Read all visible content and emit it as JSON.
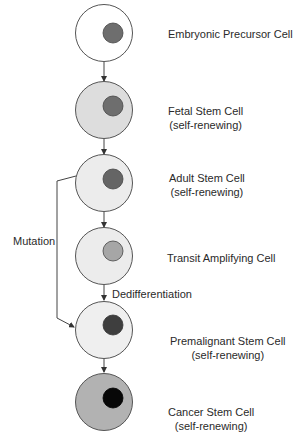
{
  "diagram": {
    "colors": {
      "outline": "#555555",
      "line": "#444444"
    },
    "cells": [
      {
        "id": "embryonic",
        "lines": [
          "Embryonic Precursor Cell"
        ],
        "cx": 104,
        "cy": 33,
        "fill": "#ffffff",
        "nucleus_fill": "#6e6e6e"
      },
      {
        "id": "fetal",
        "lines": [
          "Fetal Stem Cell",
          "(self-renewing)"
        ],
        "cx": 104,
        "cy": 110,
        "fill": "#dddddd",
        "nucleus_fill": "#6e6e6e"
      },
      {
        "id": "adult",
        "lines": [
          "Adult Stem Cell",
          "(self-renewing)"
        ],
        "cx": 104,
        "cy": 183,
        "fill": "#ececec",
        "nucleus_fill": "#656565"
      },
      {
        "id": "transit",
        "lines": [
          "Transit Amplifying Cell"
        ],
        "cx": 104,
        "cy": 256,
        "fill": "#ececec",
        "nucleus_fill": "#a6a6a6"
      },
      {
        "id": "premalignant",
        "lines": [
          "Premalignant Stem Cell",
          "(self-renewing)"
        ],
        "cx": 104,
        "cy": 330,
        "fill": "#efefef",
        "nucleus_fill": "#3e3e3e"
      },
      {
        "id": "cancer",
        "lines": [
          "Cancer Stem Cell",
          "(self-renewing)"
        ],
        "cx": 104,
        "cy": 402,
        "fill": "#b2b2b2",
        "nucleus_fill": "#080808"
      }
    ],
    "annotations": {
      "mutation": "Mutation",
      "dedifferentiation": "Dedifferentiation"
    }
  }
}
